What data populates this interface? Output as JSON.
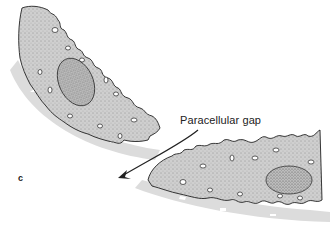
{
  "figure": {
    "panel_label": "c",
    "annotation": "Paracellular gap",
    "elements": {
      "upper_cell": {
        "shape": "epithelial-cell",
        "has_nucleus": true
      },
      "lower_cell": {
        "shape": "epithelial-cell",
        "has_nucleus": true
      },
      "arrow": {
        "direction": "down-left",
        "meaning": "paracellular-pathway"
      }
    },
    "colors": {
      "cytoplasm": "#cfcfcf",
      "stipple": "#555555",
      "outline": "#222222",
      "basal_shadow": "#dcdcdc",
      "nucleus": "#bdbdbd"
    }
  }
}
